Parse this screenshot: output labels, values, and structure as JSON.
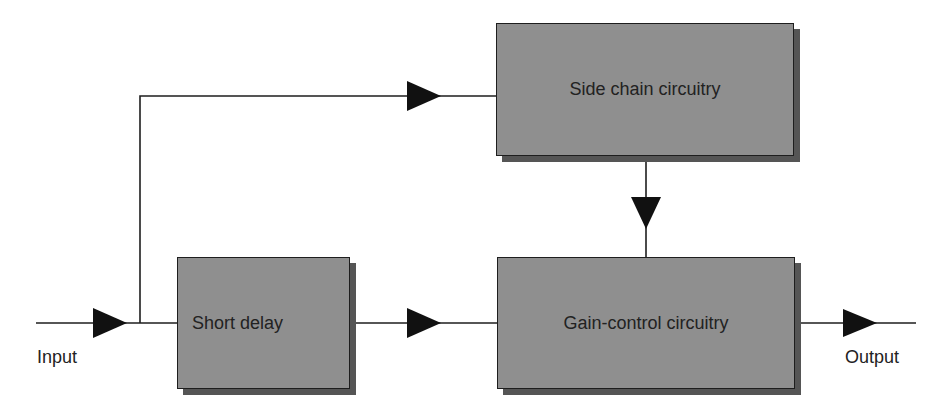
{
  "diagram": {
    "blocks": {
      "side_chain": {
        "label": "Side chain circuitry"
      },
      "short_delay": {
        "label": "Short delay"
      },
      "gain_control": {
        "label": "Gain-control circuitry"
      }
    },
    "labels": {
      "input": "Input",
      "output": "Output"
    },
    "colors": {
      "block_fill": "#8f8f8f",
      "block_shadow": "#555555",
      "line": "#1e1e1e"
    }
  }
}
